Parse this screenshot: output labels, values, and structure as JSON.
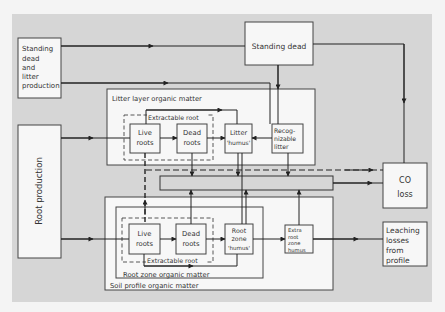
{
  "diagram": {
    "title": "",
    "nodes": {
      "standing_dead_litter_production": {
        "lines": [
          "Standing",
          "dead",
          "and",
          "litter",
          "production"
        ]
      },
      "standing_dead": {
        "label": "Standing dead"
      },
      "root_production": {
        "label": "Root production"
      },
      "litter_layer": {
        "label": "Litter layer organic matter"
      },
      "extractable_root_top": {
        "label": "Extractable root"
      },
      "live_roots_top": {
        "lines": [
          "Live",
          "roots"
        ]
      },
      "dead_roots_top": {
        "lines": [
          "Dead",
          "roots"
        ]
      },
      "litter_humus": {
        "lines": [
          "Litter",
          "'humus'"
        ]
      },
      "recognizable_litter": {
        "lines": [
          "Recog-",
          "nizable",
          "litter"
        ]
      },
      "co_loss": {
        "lines": [
          "CO",
          "loss"
        ]
      },
      "soil_profile": {
        "label": "Soil profile organic matter"
      },
      "root_zone": {
        "label": "Root zone organic matter"
      },
      "extractable_root_bottom": {
        "label": "Extractable root"
      },
      "live_roots_bottom": {
        "lines": [
          "Live",
          "roots"
        ]
      },
      "dead_roots_bottom": {
        "lines": [
          "Dead",
          "roots"
        ]
      },
      "root_zone_humus": {
        "lines": [
          "Root",
          "zone",
          "'humus'"
        ]
      },
      "extra_root_zone_humus": {
        "lines": [
          "Extra",
          "root",
          "zone",
          "humus"
        ]
      },
      "leaching_losses": {
        "lines": [
          "Leaching",
          "losses",
          "from",
          "profile"
        ]
      }
    },
    "colors": {
      "panel": "#d6d6d6",
      "box": "#f7f7f7",
      "stroke": "#2a2a2a",
      "text": "#333333"
    }
  }
}
